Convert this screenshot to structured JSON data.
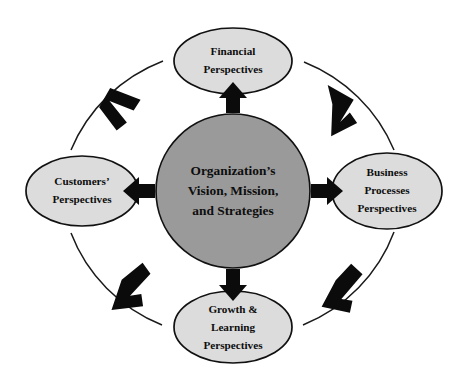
{
  "diagram": {
    "type": "cycle-diagram",
    "colors": {
      "center_fill": "#9a9a9a",
      "satellite_fill": "#dcdcdc",
      "outline": "#111111",
      "arrow": "#0b0b0b",
      "ring": "#1a1a1a",
      "text": "#0d0d0d",
      "background": "#ffffff"
    },
    "center": {
      "name": "organizations-vision-mission-strategies",
      "lines": [
        "Organization’s",
        "Vision, Mission,",
        "and Strategies"
      ]
    },
    "nodes": [
      {
        "name": "financial-perspectives",
        "position": "top",
        "lines": [
          "Financial",
          "Perspectives"
        ]
      },
      {
        "name": "business-processes-perspectives",
        "position": "right",
        "lines": [
          "Business",
          "Processes",
          "Perspectives"
        ]
      },
      {
        "name": "growth-and-learning-perspectives",
        "position": "bottom",
        "lines": [
          "Growth &",
          "Learning",
          "Perspectives"
        ]
      },
      {
        "name": "customers-perspectives",
        "position": "left",
        "lines": [
          "Customers’",
          "Perspectives"
        ]
      }
    ],
    "center_arrows": [
      {
        "name": "arrow-center-to-financial",
        "direction": "up"
      },
      {
        "name": "arrow-center-to-business-processes",
        "direction": "right"
      },
      {
        "name": "arrow-center-to-growth-learning",
        "direction": "down"
      },
      {
        "name": "arrow-center-to-customers",
        "direction": "left"
      }
    ],
    "ring_arrows": [
      {
        "name": "ring-chevron-top-left",
        "flow": "clockwise"
      },
      {
        "name": "ring-chevron-top-right",
        "flow": "clockwise"
      },
      {
        "name": "ring-chevron-bottom-right",
        "flow": "clockwise"
      },
      {
        "name": "ring-chevron-bottom-left",
        "flow": "clockwise"
      }
    ]
  }
}
